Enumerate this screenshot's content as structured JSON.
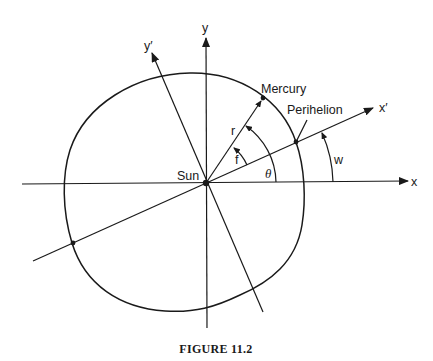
{
  "figure": {
    "caption": "FIGURE 11.2",
    "colors": {
      "ink": "#1a1a1a",
      "background": "#ffffff"
    }
  },
  "labels": {
    "y_axis": "y",
    "x_axis": "x",
    "y_prime_axis": "y′",
    "x_prime_axis": "x′",
    "sun": "Sun",
    "mercury": "Mercury",
    "perihelion": "Perihelion",
    "radius": "r",
    "true_anomaly": "f",
    "angle_theta": "θ",
    "argument_w": "w"
  }
}
